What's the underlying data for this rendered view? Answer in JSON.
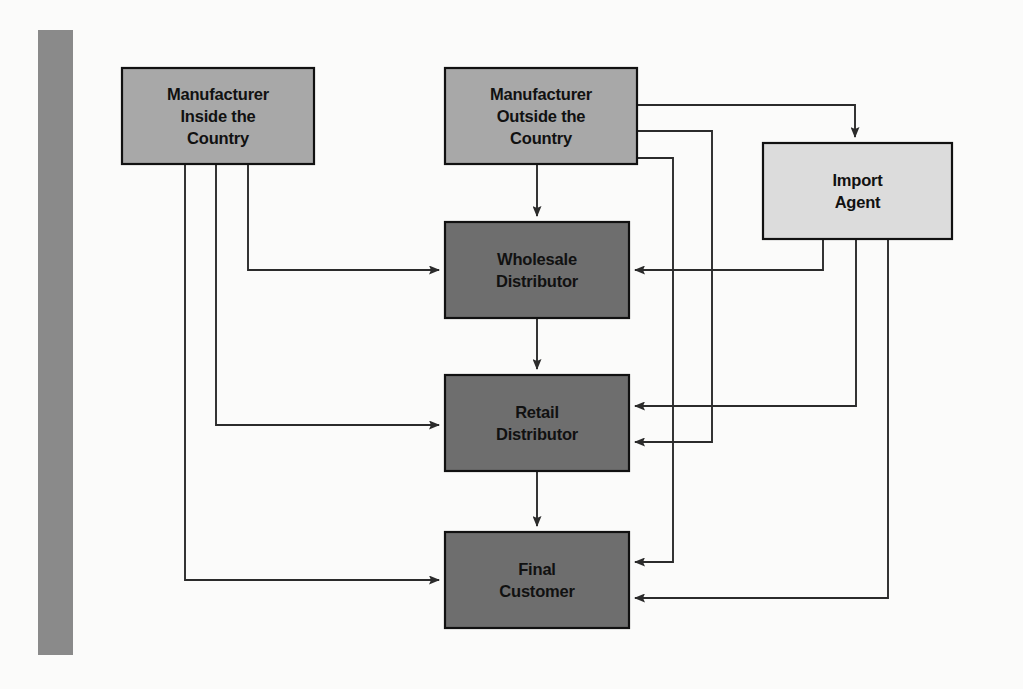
{
  "diagram": {
    "type": "flowchart",
    "accent_bar_color": "#8a8a8a",
    "background_color": "#fbfbfa",
    "nodes": [
      {
        "id": "manufacturer-inside",
        "label_lines": [
          "Manufacturer",
          "Inside the",
          "Country"
        ],
        "line1": "Manufacturer",
        "line2": "Inside the",
        "line3": "Country",
        "fill": "#a8a8a8",
        "text_color": "#111111",
        "x": 122,
        "y": 68,
        "w": 192,
        "h": 96
      },
      {
        "id": "manufacturer-outside",
        "label_lines": [
          "Manufacturer",
          "Outside the",
          "Country"
        ],
        "line1": "Manufacturer",
        "line2": "Outside the",
        "line3": "Country",
        "fill": "#a8a8a8",
        "text_color": "#111111",
        "x": 445,
        "y": 68,
        "w": 192,
        "h": 96
      },
      {
        "id": "import-agent",
        "label_lines": [
          "Import",
          "Agent"
        ],
        "line1": "Import",
        "line2": "Agent",
        "fill": "#dcdcdc",
        "text_color": "#111111",
        "x": 763,
        "y": 143,
        "w": 189,
        "h": 96
      },
      {
        "id": "wholesale-distributor",
        "label_lines": [
          "Wholesale",
          "Distributor"
        ],
        "line1": "Wholesale",
        "line2": "Distributor",
        "fill": "#6e6e6e",
        "text_color": "#111111",
        "x": 445,
        "y": 222,
        "w": 184,
        "h": 96
      },
      {
        "id": "retail-distributor",
        "label_lines": [
          "Retail",
          "Distributor"
        ],
        "line1": "Retail",
        "line2": "Distributor",
        "fill": "#6e6e6e",
        "text_color": "#111111",
        "x": 445,
        "y": 375,
        "w": 184,
        "h": 96
      },
      {
        "id": "final-customer",
        "label_lines": [
          "Final",
          "Customer"
        ],
        "line1": "Final",
        "line2": "Customer",
        "fill": "#6e6e6e",
        "text_color": "#111111",
        "x": 445,
        "y": 532,
        "w": 184,
        "h": 96
      }
    ],
    "edges": [
      {
        "id": "edge-outside-to-wholesale",
        "from": "manufacturer-outside",
        "to": "wholesale-distributor",
        "path": "M 537 164 L 537 216"
      },
      {
        "id": "edge-wholesale-to-retail",
        "from": "wholesale-distributor",
        "to": "retail-distributor",
        "path": "M 537 318 L 537 369"
      },
      {
        "id": "edge-retail-to-final",
        "from": "retail-distributor",
        "to": "final-customer",
        "path": "M 537 471 L 537 526"
      },
      {
        "id": "edge-inside-to-wholesale",
        "from": "manufacturer-inside",
        "to": "wholesale-distributor",
        "path": "M 248 164 L 248 270 L 439 270"
      },
      {
        "id": "edge-inside-to-retail",
        "from": "manufacturer-inside",
        "to": "retail-distributor",
        "path": "M 216 164 L 216 425 L 439 425"
      },
      {
        "id": "edge-inside-to-final",
        "from": "manufacturer-inside",
        "to": "final-customer",
        "path": "M 185 164 L 185 580 L 439 580"
      },
      {
        "id": "edge-outside-to-import-agent",
        "from": "manufacturer-outside",
        "to": "import-agent",
        "path": "M 637 105 L 855 105 L 855 137"
      },
      {
        "id": "edge-outside-to-retail",
        "from": "manufacturer-outside",
        "to": "retail-distributor",
        "path": "M 637 131 L 712 131 L 712 442 L 635 442"
      },
      {
        "id": "edge-outside-to-final",
        "from": "manufacturer-outside",
        "to": "final-customer",
        "path": "M 637 158 L 673 158 L 673 562 L 635 562"
      },
      {
        "id": "edge-import-agent-to-wholesale",
        "from": "import-agent",
        "to": "wholesale-distributor",
        "path": "M 823 239 L 823 270 L 635 270"
      },
      {
        "id": "edge-import-agent-to-retail",
        "from": "import-agent",
        "to": "retail-distributor",
        "path": "M 856 239 L 856 406 L 635 406"
      },
      {
        "id": "edge-import-agent-to-final",
        "from": "import-agent",
        "to": "final-customer",
        "path": "M 888 239 L 888 598 L 635 598"
      }
    ]
  }
}
